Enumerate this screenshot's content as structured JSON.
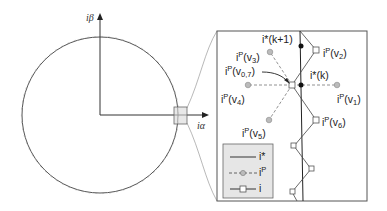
{
  "figure": {
    "axes": {
      "y_label": "iβ",
      "x_label": "iα"
    },
    "zoom_panel": {
      "points": [
        {
          "id": "v0_7",
          "label_base": "i",
          "label_sup": "P",
          "label_arg": "v",
          "label_sub": "0,7"
        },
        {
          "id": "v1",
          "label_base": "i",
          "label_sup": "P",
          "label_arg": "v",
          "label_sub": "1"
        },
        {
          "id": "v2",
          "label_base": "i",
          "label_sup": "P",
          "label_arg": "v",
          "label_sub": "2"
        },
        {
          "id": "v3",
          "label_base": "i",
          "label_sup": "P",
          "label_arg": "v",
          "label_sub": "3"
        },
        {
          "id": "v4",
          "label_base": "i",
          "label_sup": "P",
          "label_arg": "v",
          "label_sub": "4"
        },
        {
          "id": "v5",
          "label_base": "i",
          "label_sup": "P",
          "label_arg": "v",
          "label_sub": "5"
        },
        {
          "id": "v6",
          "label_base": "i",
          "label_sup": "P",
          "label_arg": "v",
          "label_sub": "6"
        }
      ],
      "reference_labels": {
        "k": "i*(k)",
        "k1": "i*(k+1)"
      }
    },
    "legend": {
      "items": [
        {
          "style": "solid",
          "label": "i*"
        },
        {
          "style": "dashed-circle",
          "label_base": "i",
          "label_sup": "P"
        },
        {
          "style": "solid-square",
          "label": "i"
        }
      ]
    },
    "colors": {
      "line": "#333333",
      "gray_marker": "#9a9a9a",
      "legend_bg": "#e6e6e6",
      "zoom_box_fill": "#d8d8d8"
    }
  }
}
